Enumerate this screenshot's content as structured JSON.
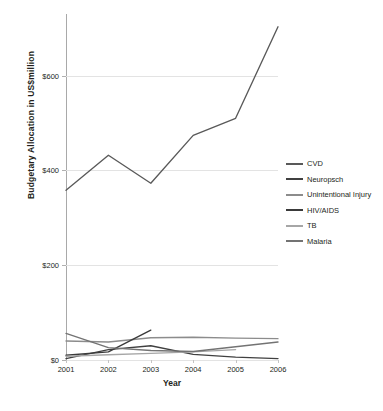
{
  "chart_data": {
    "type": "line",
    "title": "",
    "xlabel": "Year",
    "ylabel": "Budgetary Allocation in US$million",
    "x": [
      2001,
      2002,
      2003,
      2004,
      2005,
      2006
    ],
    "xticklabels": [
      "2001",
      "2002",
      "2003",
      "2004",
      "2005",
      "2006"
    ],
    "yticks": [
      0,
      200,
      400,
      600
    ],
    "yticklabels": [
      "$0",
      "$200",
      "$400",
      "$600"
    ],
    "ylim": [
      0,
      730
    ],
    "xlim": [
      2001,
      2006
    ],
    "grid": "horizontal",
    "legend_position": "right",
    "series": [
      {
        "name": "CVD",
        "color": "#595959",
        "values": [
          358,
          432,
          373,
          474,
          510,
          703
        ]
      },
      {
        "name": "Neuropsch",
        "color": "#404040",
        "values": [
          3,
          22,
          30,
          12,
          6,
          3
        ]
      },
      {
        "name": "Unintentional Injury",
        "color": "#8c8c8c",
        "values": [
          40,
          38,
          47,
          48,
          46,
          45
        ]
      },
      {
        "name": "HIV/AIDS",
        "color": "#3a3a3a",
        "values": [
          10,
          17,
          63,
          null,
          null,
          null
        ]
      },
      {
        "name": "TB",
        "color": "#a6a6a6",
        "values": [
          8,
          11,
          14,
          17,
          22,
          null
        ]
      },
      {
        "name": "Malaria",
        "color": "#737373",
        "values": [
          56,
          26,
          20,
          18,
          28,
          38
        ]
      }
    ]
  },
  "legend": {
    "items": [
      {
        "label": "CVD"
      },
      {
        "label": "Neuropsch"
      },
      {
        "label": "Unintentional Injury"
      },
      {
        "label": "HIV/AIDS"
      },
      {
        "label": "TB"
      },
      {
        "label": "Malaria"
      }
    ]
  }
}
